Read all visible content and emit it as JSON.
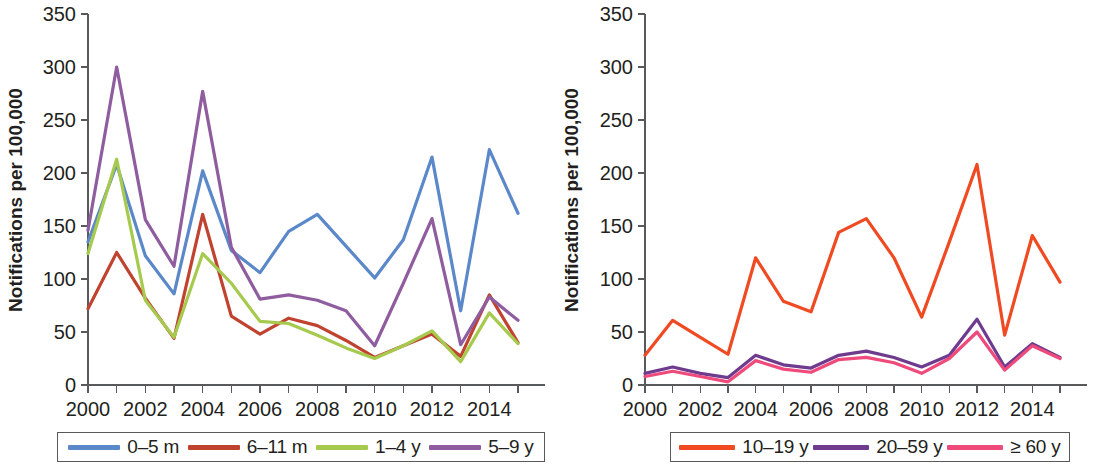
{
  "figure": {
    "width": 1094,
    "height": 465,
    "background": "#ffffff"
  },
  "chart_data": [
    {
      "id": "panel-left",
      "type": "line",
      "title": "",
      "xlabel": "",
      "ylabel": "Notifications per 100,000",
      "x": [
        2000,
        2001,
        2002,
        2003,
        2004,
        2005,
        2006,
        2007,
        2008,
        2009,
        2010,
        2011,
        2012,
        2013,
        2014,
        2015
      ],
      "xtick_values": [
        2000,
        2001,
        2002,
        2003,
        2004,
        2005,
        2006,
        2007,
        2008,
        2009,
        2010,
        2011,
        2012,
        2013,
        2014,
        2015
      ],
      "xtick_labels": [
        "2000",
        "",
        "2002",
        "",
        "2004",
        "",
        "2006",
        "",
        "2008",
        "",
        "2010",
        "",
        "2012",
        "",
        "2014",
        ""
      ],
      "xlim": [
        2000,
        2015
      ],
      "ylim": [
        0,
        350
      ],
      "ytick_values": [
        0,
        50,
        100,
        150,
        200,
        250,
        300,
        350
      ],
      "ytick_labels": [
        "0",
        "50",
        "100",
        "150",
        "200",
        "250",
        "300",
        "350"
      ],
      "grid": false,
      "legend_position": "below",
      "series": [
        {
          "name": "0–5 m",
          "color": "#5b88c9",
          "values": [
            135,
            208,
            122,
            86,
            202,
            127,
            106,
            145,
            161,
            131,
            101,
            137,
            215,
            70,
            222,
            162
          ]
        },
        {
          "name": "6–11 m",
          "color": "#c0432f",
          "values": [
            72,
            125,
            82,
            44,
            161,
            65,
            48,
            63,
            56,
            42,
            26,
            37,
            48,
            27,
            85,
            40
          ]
        },
        {
          "name": "1–4 y",
          "color": "#a6ca4e",
          "values": [
            124,
            213,
            80,
            45,
            124,
            96,
            60,
            58,
            47,
            35,
            25,
            37,
            51,
            22,
            68,
            39
          ]
        },
        {
          "name": "5–9 y",
          "color": "#8f5d9f",
          "values": [
            146,
            300,
            156,
            112,
            277,
            130,
            81,
            85,
            80,
            70,
            37,
            96,
            157,
            38,
            83,
            61
          ]
        }
      ]
    },
    {
      "id": "panel-right",
      "type": "line",
      "title": "",
      "xlabel": "",
      "ylabel": "Notifications per 100,000",
      "x": [
        2000,
        2001,
        2002,
        2003,
        2004,
        2005,
        2006,
        2007,
        2008,
        2009,
        2010,
        2011,
        2012,
        2013,
        2014,
        2015
      ],
      "xtick_values": [
        2000,
        2001,
        2002,
        2003,
        2004,
        2005,
        2006,
        2007,
        2008,
        2009,
        2010,
        2011,
        2012,
        2013,
        2014,
        2015
      ],
      "xtick_labels": [
        "2000",
        "",
        "2002",
        "",
        "2004",
        "",
        "2006",
        "",
        "2008",
        "",
        "2010",
        "",
        "2012",
        "",
        "2014",
        ""
      ],
      "xlim": [
        2000,
        2015
      ],
      "ylim": [
        0,
        350
      ],
      "ytick_values": [
        0,
        50,
        100,
        150,
        200,
        250,
        300,
        350
      ],
      "ytick_labels": [
        "0",
        "50",
        "100",
        "150",
        "200",
        "250",
        "300",
        "350"
      ],
      "grid": false,
      "legend_position": "below",
      "series": [
        {
          "name": "10–19 y",
          "color": "#f04a23",
          "values": [
            28,
            61,
            45,
            29,
            120,
            79,
            69,
            144,
            157,
            120,
            64,
            135,
            208,
            47,
            141,
            97
          ]
        },
        {
          "name": "20–59 y",
          "color": "#6e3b8e",
          "values": [
            11,
            17,
            11,
            7,
            28,
            19,
            16,
            28,
            32,
            26,
            17,
            28,
            62,
            17,
            39,
            26
          ]
        },
        {
          "name": "≥ 60 y",
          "color": "#ee4a7b",
          "values": [
            8,
            13,
            8,
            3,
            23,
            15,
            12,
            24,
            26,
            21,
            11,
            25,
            50,
            14,
            37,
            25
          ]
        }
      ]
    }
  ],
  "legends": {
    "left": {
      "entries": [
        {
          "label": "0–5 m",
          "color": "#5b88c9"
        },
        {
          "label": "6–11 m",
          "color": "#c0432f"
        },
        {
          "label": "1–4 y",
          "color": "#a6ca4e"
        },
        {
          "label": "5–9 y",
          "color": "#8f5d9f"
        }
      ]
    },
    "right": {
      "entries": [
        {
          "label": "10–19 y",
          "color": "#f04a23"
        },
        {
          "label": "20–59 y",
          "color": "#6e3b8e"
        },
        {
          "label": "≥ 60 y",
          "color": "#ee4a7b"
        }
      ]
    }
  }
}
